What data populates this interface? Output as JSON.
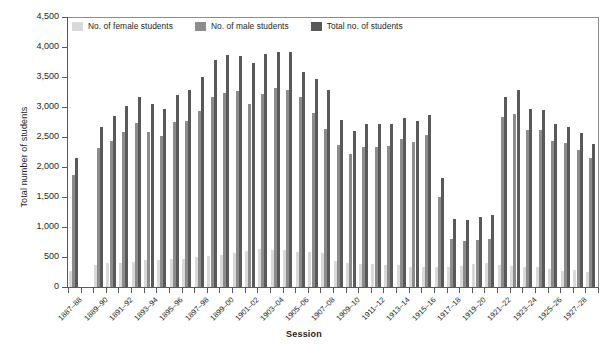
{
  "chart_data": {
    "type": "bar",
    "title": "",
    "xlabel": "Session",
    "ylabel": "Total number of students",
    "ylim": [
      0,
      4500
    ],
    "ytick_step": 500,
    "ytick_labels": [
      "0",
      "500",
      "1,000",
      "1,500",
      "2,000",
      "2,500",
      "3,000",
      "3,500",
      "4,000",
      "4,500"
    ],
    "grid": false,
    "legend_position": "top-left-inside",
    "colors": {
      "female": "#d9d9d9",
      "male": "#8c8c8c",
      "total": "#595959",
      "axis": "#58595b",
      "text": "#231f20"
    },
    "series": [
      {
        "name": "No. of female students",
        "key": "female",
        "color": "#d9d9d9"
      },
      {
        "name": "No. of male students",
        "key": "male",
        "color": "#8c8c8c"
      },
      {
        "name": "Total no. of students",
        "key": "total",
        "color": "#595959"
      }
    ],
    "categories": [
      "1887-88",
      "1888-89",
      "1889-90",
      "1890-91",
      "1891-92",
      "1892-93",
      "1893-94",
      "1894-95",
      "1895-96",
      "1896-97",
      "1897-98",
      "1898-99",
      "1899-00",
      "1900-01",
      "1901-02",
      "1902-03",
      "1903-04",
      "1904-05",
      "1905-06",
      "1906-07",
      "1907-08",
      "1908-09",
      "1909-10",
      "1910-11",
      "1911-12",
      "1912-13",
      "1913-14",
      "1914-15",
      "1915-16",
      "1916-17",
      "1917-18",
      "1918-19",
      "1919-20",
      "1920-21",
      "1921-22",
      "1922-23",
      "1923-24",
      "1924-25",
      "1925-26",
      "1926-27",
      "1927-28",
      "1928-29"
    ],
    "tick_labels_shown": [
      "1887-88",
      "",
      "1889-90",
      "",
      "1891-92",
      "",
      "1893-94",
      "",
      "1895-96",
      "",
      "1897-98",
      "",
      "1899-00",
      "",
      "1901-02",
      "",
      "1903-04",
      "",
      "1905-06",
      "",
      "1907-08",
      "",
      "1909-10",
      "",
      "1911-12",
      "",
      "1913-14",
      "",
      "1915-16",
      "",
      "1917-18",
      "",
      "1919-20",
      "",
      "1921-22",
      "",
      "1923-24",
      "",
      "1925-26",
      "",
      "1927-28",
      ""
    ],
    "values": {
      "female": [
        260,
        null,
        370,
        400,
        400,
        420,
        450,
        450,
        470,
        470,
        500,
        520,
        540,
        560,
        600,
        640,
        620,
        620,
        590,
        580,
        560,
        430,
        400,
        390,
        380,
        370,
        360,
        340,
        330,
        330,
        340,
        350,
        380,
        400,
        360,
        350,
        340,
        340,
        300,
        270,
        290,
        250
      ],
      "male": [
        1870,
        null,
        2310,
        2430,
        2590,
        2740,
        2590,
        2510,
        2750,
        2760,
        2940,
        3160,
        3240,
        3270,
        3050,
        3210,
        3320,
        3290,
        3160,
        2900,
        2640,
        2360,
        2220,
        2340,
        2340,
        2350,
        2460,
        2420,
        2540,
        1500,
        800,
        760,
        790,
        800,
        2830,
        2890,
        2620,
        2620,
        2430,
        2400,
        2280,
        2150
      ],
      "total": [
        2150,
        null,
        2660,
        2850,
        3020,
        3170,
        3050,
        2960,
        3200,
        3290,
        3500,
        3780,
        3860,
        3850,
        3730,
        3880,
        3920,
        3920,
        3580,
        3470,
        3280,
        2790,
        2600,
        2720,
        2710,
        2720,
        2810,
        2760,
        2870,
        1810,
        1130,
        1110,
        1160,
        1200,
        3160,
        3290,
        2960,
        2950,
        2720,
        2660,
        2560,
        2390
      ]
    }
  },
  "axes": {
    "y_title": "Total number of students",
    "x_title": "Session"
  },
  "legend": {
    "items": [
      {
        "label": "No. of female students"
      },
      {
        "label": "No. of male students"
      },
      {
        "label": "Total no. of students"
      }
    ]
  }
}
